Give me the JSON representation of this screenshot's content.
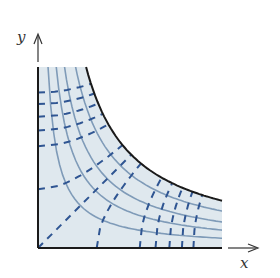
{
  "figure": {
    "x_axis_label": "x",
    "y_axis_label": "y",
    "origin_px": [
      38,
      248
    ],
    "boundary_k": 8700,
    "region_x_max": 184,
    "region_y_max": 181,
    "streamline_k": [
      1800,
      3300,
      4800,
      6800
    ],
    "equipotential_c": [
      -27600,
      -24150,
      -20700,
      -17250,
      -13800,
      -10350,
      -6900,
      -3450,
      0,
      3450,
      6900,
      10350,
      13800,
      17250,
      20700,
      24150,
      27600
    ],
    "colors": {
      "fill": "#dfe8ee",
      "boundary": "#1a1a1a",
      "streamline": "#7f9bb8",
      "equipotential": "#2f5592",
      "axis": "#333333"
    }
  }
}
